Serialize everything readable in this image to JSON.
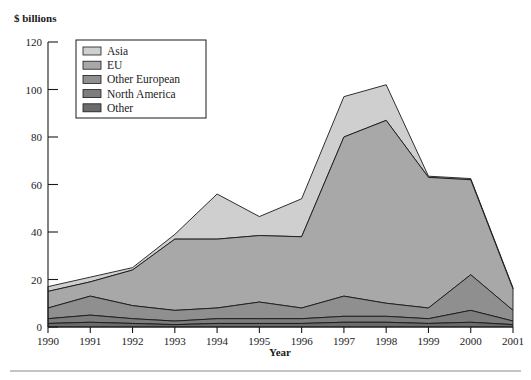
{
  "chart_data": {
    "type": "area",
    "stacked": true,
    "title": "",
    "ylabel": "$ billions",
    "xlabel": "Year",
    "grid": false,
    "legend_position": "top-left-inside",
    "ylim": [
      0,
      120
    ],
    "yticks": [
      0,
      20,
      40,
      60,
      80,
      100,
      120
    ],
    "ytick_labels": [
      "0",
      "20",
      "40",
      "60",
      "80",
      "100",
      "120"
    ],
    "categories": [
      "1990",
      "1991",
      "1992",
      "1993",
      "1994",
      "1995",
      "1996",
      "1997",
      "1998",
      "1999",
      "2000",
      "2001"
    ],
    "x": [
      1990,
      1991,
      1992,
      1993,
      1994,
      1995,
      1996,
      1997,
      1998,
      1999,
      2000,
      2001
    ],
    "series": [
      {
        "name": "Other",
        "color": "#6b6b6b",
        "values": [
          1.5,
          2.0,
          1.5,
          1.0,
          1.5,
          1.5,
          1.5,
          2.0,
          2.0,
          1.5,
          2.0,
          1.0
        ]
      },
      {
        "name": "North America",
        "color": "#7d7d7d",
        "values": [
          2.0,
          3.0,
          2.0,
          1.5,
          2.0,
          2.0,
          2.0,
          2.5,
          2.5,
          2.0,
          5.0,
          1.5
        ]
      },
      {
        "name": "Other European",
        "color": "#8f8f8f",
        "values": [
          4.5,
          8.0,
          5.5,
          4.5,
          4.5,
          7.0,
          4.5,
          8.5,
          5.5,
          4.5,
          15.0,
          4.5
        ]
      },
      {
        "name": "EU",
        "color": "#a8a8a8",
        "values": [
          7.0,
          6.0,
          15.0,
          30.0,
          29.0,
          28.0,
          30.0,
          67.0,
          77.0,
          55.0,
          40.0,
          9.0
        ]
      },
      {
        "name": "Asia",
        "color": "#cfcfcf",
        "values": [
          2.0,
          2.0,
          1.0,
          2.0,
          19.0,
          8.0,
          16.0,
          17.0,
          15.0,
          0.5,
          0.5,
          0.5
        ]
      }
    ],
    "stack_totals": [
      17.0,
      21.0,
      25.0,
      39.0,
      56.0,
      46.5,
      54.0,
      97.0,
      102.0,
      63.5,
      62.5,
      16.5
    ],
    "legend_entries": [
      {
        "label": "Asia",
        "color": "#cfcfcf"
      },
      {
        "label": "EU",
        "color": "#a8a8a8"
      },
      {
        "label": "Other European",
        "color": "#8f8f8f"
      },
      {
        "label": "North America",
        "color": "#7d7d7d"
      },
      {
        "label": "Other",
        "color": "#6b6b6b"
      }
    ]
  },
  "labels": {
    "ylabel": "$ billions",
    "xlabel": "Year"
  }
}
